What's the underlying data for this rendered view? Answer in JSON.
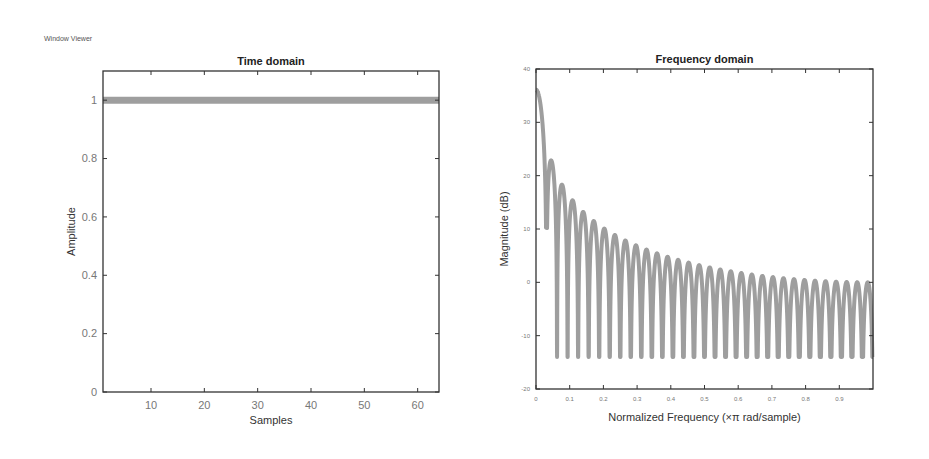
{
  "window": {
    "title": "Window Viewer"
  },
  "chart_data": [
    {
      "type": "line",
      "title": "Time domain",
      "xlabel": "Samples",
      "ylabel": "Amplitude",
      "xlim": [
        1,
        64
      ],
      "ylim": [
        0,
        1.1
      ],
      "xticks": [
        10,
        20,
        30,
        40,
        50,
        60
      ],
      "yticks": [
        0,
        0.2,
        0.4,
        0.6,
        0.8,
        1
      ],
      "ytick_labels": [
        "0",
        "0.2",
        "0.4",
        "0.6",
        "0.8",
        "1"
      ],
      "grid": false,
      "series": [
        {
          "name": "rectangular window",
          "x_start": 1,
          "x_end": 64,
          "value": 1,
          "color": "#9e9e9e"
        }
      ]
    },
    {
      "type": "line",
      "title": "Frequency domain",
      "xlabel": "Normalized Frequency  (×π rad/sample)",
      "ylabel": "Magnitude (dB)",
      "xlim": [
        0,
        1
      ],
      "ylim": [
        -20,
        40
      ],
      "xticks": [
        0,
        0.1,
        0.2,
        0.3,
        0.4,
        0.5,
        0.6,
        0.7,
        0.8,
        0.9
      ],
      "xtick_labels": [
        "0",
        "0.1",
        "0.2",
        "0.3",
        "0.4",
        "0.5",
        "0.6",
        "0.7",
        "0.8",
        "0.9"
      ],
      "yticks": [
        -20,
        -10,
        0,
        10,
        20,
        30,
        40
      ],
      "ytick_labels": [
        "-20",
        "-10",
        "0",
        "10",
        "20",
        "30",
        "40"
      ],
      "grid": false,
      "series": [
        {
          "name": "magnitude response",
          "window_length": 64,
          "peak_db": 36.1,
          "sidelobe_peaks_db_near_end": 2,
          "trough_floor_db_near_end": -14,
          "color": "#9e9e9e"
        }
      ]
    }
  ]
}
